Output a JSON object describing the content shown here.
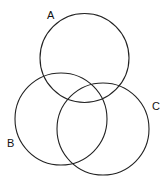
{
  "diagram": {
    "type": "venn",
    "sets": [
      {
        "id": "A",
        "label": "A"
      },
      {
        "id": "B",
        "label": "B"
      },
      {
        "id": "C",
        "label": "C"
      }
    ],
    "stroke_color": "#222222",
    "background": "#ffffff"
  }
}
